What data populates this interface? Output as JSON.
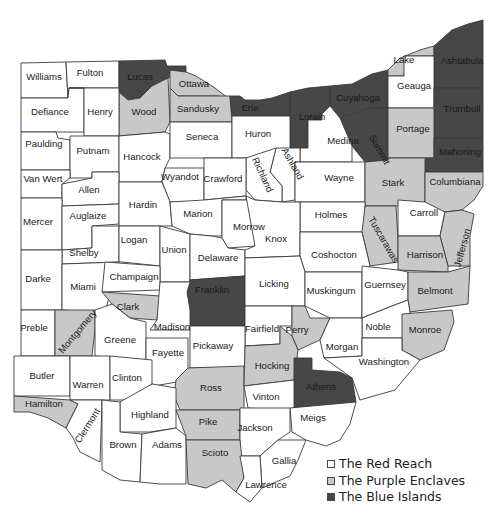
{
  "colors": {
    "red_reach": "#ffffff",
    "purple_enclaves": "#c8c8c8",
    "blue_islands": "#474747",
    "border": "#3a3a3a",
    "lake": "#ffffff"
  },
  "legend": {
    "items": [
      {
        "label": "The Red Reach",
        "category": "red_reach"
      },
      {
        "label": "The Purple Enclaves",
        "category": "purple_enclaves"
      },
      {
        "label": "The Blue Islands",
        "category": "blue_islands"
      }
    ]
  },
  "counties": [
    {
      "name": "Williams",
      "category": "red_reach"
    },
    {
      "name": "Fulton",
      "category": "red_reach"
    },
    {
      "name": "Lucas",
      "category": "blue_islands"
    },
    {
      "name": "Ottawa",
      "category": "purple_enclaves"
    },
    {
      "name": "Wood",
      "category": "purple_enclaves"
    },
    {
      "name": "Sandusky",
      "category": "purple_enclaves"
    },
    {
      "name": "Erie",
      "category": "blue_islands"
    },
    {
      "name": "Lorain",
      "category": "blue_islands"
    },
    {
      "name": "Cuyahoga",
      "category": "blue_islands"
    },
    {
      "name": "Lake",
      "category": "purple_enclaves"
    },
    {
      "name": "Ashtabula",
      "category": "blue_islands"
    },
    {
      "name": "Geauga",
      "category": "red_reach"
    },
    {
      "name": "Trumbull",
      "category": "blue_islands"
    },
    {
      "name": "Summit",
      "category": "blue_islands"
    },
    {
      "name": "Portage",
      "category": "purple_enclaves"
    },
    {
      "name": "Mahoning",
      "category": "blue_islands"
    },
    {
      "name": "Defiance",
      "category": "red_reach"
    },
    {
      "name": "Henry",
      "category": "red_reach"
    },
    {
      "name": "Paulding",
      "category": "red_reach"
    },
    {
      "name": "Putnam",
      "category": "red_reach"
    },
    {
      "name": "Hancock",
      "category": "red_reach"
    },
    {
      "name": "Seneca",
      "category": "red_reach"
    },
    {
      "name": "Huron",
      "category": "red_reach"
    },
    {
      "name": "Medina",
      "category": "red_reach"
    },
    {
      "name": "Ashland",
      "category": "red_reach"
    },
    {
      "name": "Richland",
      "category": "red_reach"
    },
    {
      "name": "Wayne",
      "category": "red_reach"
    },
    {
      "name": "Stark",
      "category": "purple_enclaves"
    },
    {
      "name": "Columbiana",
      "category": "purple_enclaves"
    },
    {
      "name": "Van Wert",
      "category": "red_reach"
    },
    {
      "name": "Allen",
      "category": "red_reach"
    },
    {
      "name": "Wyandot",
      "category": "red_reach"
    },
    {
      "name": "Crawford",
      "category": "red_reach"
    },
    {
      "name": "Mercer",
      "category": "red_reach"
    },
    {
      "name": "Auglaize",
      "category": "red_reach"
    },
    {
      "name": "Hardin",
      "category": "red_reach"
    },
    {
      "name": "Marion",
      "category": "red_reach"
    },
    {
      "name": "Morrow",
      "category": "red_reach"
    },
    {
      "name": "Holmes",
      "category": "red_reach"
    },
    {
      "name": "Tuscarawas",
      "category": "purple_enclaves"
    },
    {
      "name": "Carroll",
      "category": "red_reach"
    },
    {
      "name": "Jefferson",
      "category": "purple_enclaves"
    },
    {
      "name": "Harrison",
      "category": "purple_enclaves"
    },
    {
      "name": "Shelby",
      "category": "red_reach"
    },
    {
      "name": "Logan",
      "category": "red_reach"
    },
    {
      "name": "Union",
      "category": "red_reach"
    },
    {
      "name": "Delaware",
      "category": "red_reach"
    },
    {
      "name": "Knox",
      "category": "red_reach"
    },
    {
      "name": "Coshocton",
      "category": "red_reach"
    },
    {
      "name": "Darke",
      "category": "red_reach"
    },
    {
      "name": "Miami",
      "category": "red_reach"
    },
    {
      "name": "Champaign",
      "category": "red_reach"
    },
    {
      "name": "Franklin",
      "category": "blue_islands"
    },
    {
      "name": "Licking",
      "category": "red_reach"
    },
    {
      "name": "Muskingum",
      "category": "red_reach"
    },
    {
      "name": "Guernsey",
      "category": "red_reach"
    },
    {
      "name": "Belmont",
      "category": "purple_enclaves"
    },
    {
      "name": "Clark",
      "category": "purple_enclaves"
    },
    {
      "name": "Madison",
      "category": "red_reach"
    },
    {
      "name": "Preble",
      "category": "red_reach"
    },
    {
      "name": "Montgomery",
      "category": "purple_enclaves"
    },
    {
      "name": "Greene",
      "category": "red_reach"
    },
    {
      "name": "Fairfield",
      "category": "red_reach"
    },
    {
      "name": "Perry",
      "category": "purple_enclaves"
    },
    {
      "name": "Noble",
      "category": "red_reach"
    },
    {
      "name": "Monroe",
      "category": "purple_enclaves"
    },
    {
      "name": "Fayette",
      "category": "red_reach"
    },
    {
      "name": "Pickaway",
      "category": "red_reach"
    },
    {
      "name": "Morgan",
      "category": "red_reach"
    },
    {
      "name": "Washington",
      "category": "red_reach"
    },
    {
      "name": "Butler",
      "category": "red_reach"
    },
    {
      "name": "Warren",
      "category": "red_reach"
    },
    {
      "name": "Clinton",
      "category": "red_reach"
    },
    {
      "name": "Ross",
      "category": "purple_enclaves"
    },
    {
      "name": "Hocking",
      "category": "purple_enclaves"
    },
    {
      "name": "Athens",
      "category": "blue_islands"
    },
    {
      "name": "Vinton",
      "category": "red_reach"
    },
    {
      "name": "Hamilton",
      "category": "purple_enclaves"
    },
    {
      "name": "Clermont",
      "category": "red_reach"
    },
    {
      "name": "Highland",
      "category": "red_reach"
    },
    {
      "name": "Meigs",
      "category": "red_reach"
    },
    {
      "name": "Brown",
      "category": "red_reach"
    },
    {
      "name": "Adams",
      "category": "red_reach"
    },
    {
      "name": "Pike",
      "category": "purple_enclaves"
    },
    {
      "name": "Jackson",
      "category": "red_reach"
    },
    {
      "name": "Scioto",
      "category": "purple_enclaves"
    },
    {
      "name": "Gallia",
      "category": "red_reach"
    },
    {
      "name": "Lawrence",
      "category": "red_reach"
    }
  ]
}
